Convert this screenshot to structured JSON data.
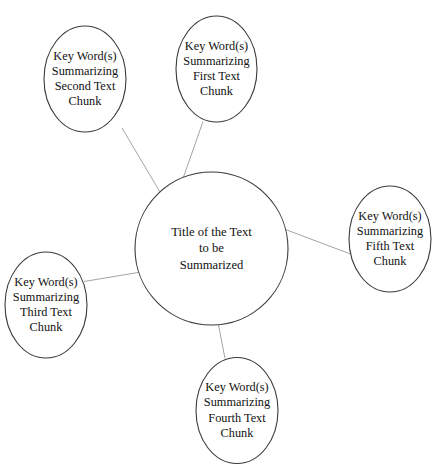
{
  "diagram": {
    "type": "concept-map-spider",
    "cut_off_header": "Sample Semantic Web Organizer",
    "center_node": {
      "id": "center",
      "lines": [
        "Title of the Text",
        "to be",
        "Summarized"
      ],
      "shape": "circle",
      "cx": 211.5,
      "cy": 248.5,
      "rx": 76.5,
      "ry": 76.5
    },
    "satellite_nodes": [
      {
        "id": "first-text-chunk",
        "lines": [
          "Key Word(s)",
          "Summarizing",
          "First Text",
          "Chunk"
        ],
        "shape": "ellipse",
        "cx": 216.5,
        "cy": 69,
        "rx": 40.5,
        "ry": 53
      },
      {
        "id": "second-text-chunk",
        "lines": [
          "Key Word(s)",
          "Summarizing",
          "Second Text",
          "Chunk"
        ],
        "shape": "ellipse",
        "cx": 85,
        "cy": 79,
        "rx": 41,
        "ry": 53
      },
      {
        "id": "third-text-chunk",
        "lines": [
          "Key Word(s)",
          "Summarizing",
          "Third Text",
          "Chunk"
        ],
        "shape": "ellipse",
        "cx": 46,
        "cy": 305,
        "rx": 41,
        "ry": 53
      },
      {
        "id": "fourth-text-chunk",
        "lines": [
          "Key Word(s)",
          "Summarizing",
          "Fourth Text",
          "Chunk"
        ],
        "shape": "ellipse",
        "cx": 237,
        "cy": 410.5,
        "rx": 41,
        "ry": 53
      },
      {
        "id": "fifth-text-chunk",
        "lines": [
          "Key Word(s)",
          "Summarizing",
          "Fifth Text",
          "Chunk"
        ],
        "shape": "ellipse",
        "cx": 390,
        "cy": 239,
        "rx": 41,
        "ry": 53
      }
    ],
    "connectors": [
      {
        "id": "center-to-first",
        "from": "center",
        "to": "first-text-chunk",
        "x1": 183.5,
        "y1": 177.0,
        "x2": 203.0,
        "y2": 121.5
      },
      {
        "id": "center-to-second",
        "from": "center",
        "to": "second-text-chunk",
        "x1": 160.0,
        "y1": 192.0,
        "x2": 122.0,
        "y2": 128.0
      },
      {
        "id": "center-to-third",
        "from": "center",
        "to": "third-text-chunk",
        "x1": 141.0,
        "y1": 272.0,
        "x2": 84.0,
        "y2": 281.5
      },
      {
        "id": "center-to-fourth",
        "from": "center",
        "to": "fourth-text-chunk",
        "x1": 218.5,
        "y1": 325.0,
        "x2": 225.0,
        "y2": 358.5
      },
      {
        "id": "center-to-fifth",
        "from": "center",
        "to": "fifth-text-chunk",
        "x1": 285.5,
        "y1": 229.5,
        "x2": 350.5,
        "y2": 254.0
      }
    ],
    "styles": {
      "node_stroke_color": "#3a3a3c",
      "node_stroke_width": 1.1,
      "node_fill": "#ffffff",
      "connector_color": "#9a9a9e",
      "connector_width": 0.9,
      "text_color": "#111111",
      "background": "#ffffff"
    }
  }
}
